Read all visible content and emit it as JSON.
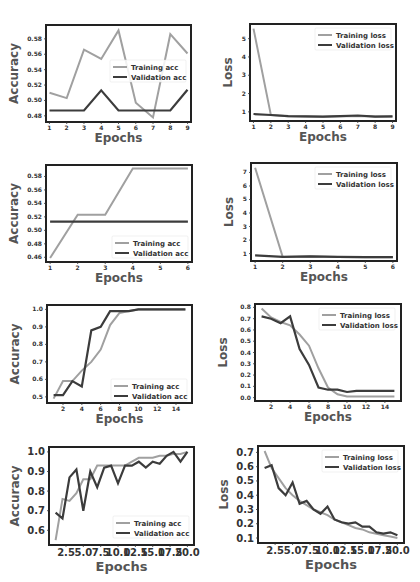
{
  "colors": {
    "training": "#a0a0a0",
    "validation": "#3c3c3c",
    "frame": "#222222"
  },
  "chart_data": [
    {
      "id": "acc-1",
      "type": "line",
      "title": "",
      "xlabel": "Epochs",
      "ylabel": "Accuracy",
      "xlim": [
        0.8,
        9.2
      ],
      "ylim": [
        0.472,
        0.598
      ],
      "xticks": [
        1,
        2,
        3,
        4,
        5,
        6,
        7,
        8,
        9
      ],
      "xtick_labels": [
        "1",
        "2",
        "3",
        "4",
        "5",
        "6",
        "7",
        "8",
        "9"
      ],
      "yticks": [
        0.48,
        0.5,
        0.52,
        0.54,
        0.56,
        0.58
      ],
      "ytick_labels": [
        "0.48",
        "0.50",
        "0.52",
        "0.54",
        "0.56",
        "0.58"
      ],
      "legend_position": "center-right",
      "series": [
        {
          "name": "Training acc",
          "role": "training",
          "x": [
            1,
            2,
            3,
            4,
            5,
            6,
            7,
            8,
            9
          ],
          "values": [
            0.51,
            0.503,
            0.566,
            0.554,
            0.591,
            0.497,
            0.478,
            0.586,
            0.561
          ]
        },
        {
          "name": "Validation acc",
          "role": "validation",
          "x": [
            1,
            2,
            3,
            4,
            5,
            6,
            7,
            8,
            9
          ],
          "values": [
            0.487,
            0.487,
            0.487,
            0.513,
            0.487,
            0.487,
            0.487,
            0.487,
            0.514
          ]
        }
      ]
    },
    {
      "id": "loss-1",
      "type": "line",
      "title": "",
      "xlabel": "Epochs",
      "ylabel": "Loss",
      "xlim": [
        0.8,
        9.2
      ],
      "ylim": [
        0.5,
        5.8
      ],
      "xticks": [
        1,
        2,
        3,
        4,
        5,
        6,
        7,
        8,
        9
      ],
      "xtick_labels": [
        "1",
        "2",
        "3",
        "4",
        "5",
        "6",
        "7",
        "8",
        "9"
      ],
      "yticks": [
        1,
        2,
        3,
        4,
        5
      ],
      "ytick_labels": [
        "1",
        "2",
        "3",
        "4",
        "5"
      ],
      "legend_position": "top-right",
      "series": [
        {
          "name": "Training loss",
          "role": "training",
          "x": [
            1,
            2,
            3,
            4,
            5,
            6,
            7,
            8,
            9
          ],
          "values": [
            5.55,
            0.82,
            0.76,
            0.75,
            0.73,
            0.76,
            0.78,
            0.74,
            0.75
          ]
        },
        {
          "name": "Validation loss",
          "role": "validation",
          "x": [
            1,
            2,
            3,
            4,
            5,
            6,
            7,
            8,
            9
          ],
          "values": [
            0.88,
            0.83,
            0.76,
            0.75,
            0.74,
            0.76,
            0.8,
            0.74,
            0.75
          ]
        }
      ]
    },
    {
      "id": "acc-2",
      "type": "line",
      "title": "",
      "xlabel": "Epochs",
      "ylabel": "Accuracy",
      "xlim": [
        0.85,
        6.15
      ],
      "ylim": [
        0.453,
        0.597
      ],
      "xticks": [
        1,
        2,
        3,
        4,
        5,
        6
      ],
      "xtick_labels": [
        "1",
        "2",
        "3",
        "4",
        "5",
        "6"
      ],
      "yticks": [
        0.46,
        0.48,
        0.5,
        0.52,
        0.54,
        0.56,
        0.58
      ],
      "ytick_labels": [
        "0.46",
        "0.48",
        "0.50",
        "0.52",
        "0.54",
        "0.56",
        "0.58"
      ],
      "legend_position": "lower-right",
      "series": [
        {
          "name": "Training acc",
          "role": "training",
          "x": [
            1,
            2,
            3,
            4,
            5,
            6
          ],
          "values": [
            0.459,
            0.523,
            0.523,
            0.592,
            0.592,
            0.592
          ]
        },
        {
          "name": "Validation acc",
          "role": "validation",
          "x": [
            1,
            2,
            3,
            4,
            5,
            6
          ],
          "values": [
            0.513,
            0.513,
            0.513,
            0.513,
            0.513,
            0.513
          ]
        }
      ]
    },
    {
      "id": "loss-2",
      "type": "line",
      "title": "",
      "xlabel": "Epochs",
      "ylabel": "Loss",
      "xlim": [
        0.85,
        6.15
      ],
      "ylim": [
        0.45,
        7.7
      ],
      "xticks": [
        1,
        2,
        3,
        4,
        5,
        6
      ],
      "xtick_labels": [
        "1",
        "2",
        "3",
        "4",
        "5",
        "6"
      ],
      "yticks": [
        1,
        2,
        3,
        4,
        5,
        6,
        7
      ],
      "ytick_labels": [
        "1",
        "2",
        "3",
        "4",
        "5",
        "6",
        "7"
      ],
      "legend_position": "top-right",
      "series": [
        {
          "name": "Training loss",
          "role": "training",
          "x": [
            1,
            2,
            3,
            4,
            5,
            6
          ],
          "values": [
            7.35,
            0.75,
            0.78,
            0.75,
            0.73,
            0.73
          ]
        },
        {
          "name": "Validation loss",
          "role": "validation",
          "x": [
            1,
            2,
            3,
            4,
            5,
            6
          ],
          "values": [
            0.87,
            0.76,
            0.8,
            0.75,
            0.73,
            0.73
          ]
        }
      ]
    },
    {
      "id": "acc-3",
      "type": "line",
      "title": "",
      "xlabel": "Epochs",
      "ylabel": "Accuracy",
      "xlim": [
        0.3,
        15.7
      ],
      "ylim": [
        0.465,
        1.025
      ],
      "xticks": [
        2,
        4,
        6,
        8,
        10,
        12,
        14
      ],
      "xtick_labels": [
        "2",
        "4",
        "6",
        "8",
        "10",
        "12",
        "14"
      ],
      "yticks": [
        0.5,
        0.6,
        0.7,
        0.8,
        0.9,
        1.0
      ],
      "ytick_labels": [
        "0.5",
        "0.6",
        "0.7",
        "0.8",
        "0.9",
        "1.0"
      ],
      "legend_position": "lower-right",
      "series": [
        {
          "name": "Training acc",
          "role": "training",
          "x": [
            1,
            2,
            3,
            4,
            5,
            6,
            7,
            8,
            9,
            10,
            11,
            12,
            13,
            14,
            15
          ],
          "values": [
            0.49,
            0.59,
            0.59,
            0.65,
            0.7,
            0.77,
            0.91,
            0.98,
            0.99,
            1.0,
            1.0,
            1.0,
            1.0,
            1.0,
            1.0
          ]
        },
        {
          "name": "Validation acc",
          "role": "validation",
          "x": [
            1,
            2,
            3,
            4,
            5,
            6,
            7,
            8,
            9,
            10,
            11,
            12,
            13,
            14,
            15
          ],
          "values": [
            0.51,
            0.51,
            0.59,
            0.56,
            0.88,
            0.9,
            0.99,
            0.99,
            0.99,
            1.0,
            1.0,
            1.0,
            1.0,
            1.0,
            1.0
          ]
        }
      ]
    },
    {
      "id": "loss-3",
      "type": "line",
      "title": "",
      "xlabel": "Epochs",
      "ylabel": "Loss",
      "xlim": [
        0.3,
        15.7
      ],
      "ylim": [
        -0.03,
        0.83
      ],
      "xticks": [
        2,
        4,
        6,
        8,
        10,
        12,
        14
      ],
      "xtick_labels": [
        "2",
        "4",
        "6",
        "8",
        "10",
        "12",
        "14"
      ],
      "yticks": [
        0.0,
        0.1,
        0.2,
        0.3,
        0.4,
        0.5,
        0.6,
        0.7,
        0.8
      ],
      "ytick_labels": [
        "0.0",
        "0.1",
        "0.2",
        "0.3",
        "0.4",
        "0.5",
        "0.6",
        "0.7",
        "0.8"
      ],
      "legend_position": "top-right",
      "series": [
        {
          "name": "Training loss",
          "role": "training",
          "x": [
            1,
            2,
            3,
            4,
            5,
            6,
            7,
            8,
            9,
            10,
            11,
            12,
            13,
            14,
            15
          ],
          "values": [
            0.79,
            0.71,
            0.67,
            0.64,
            0.56,
            0.46,
            0.26,
            0.09,
            0.03,
            0.01,
            0.01,
            0.01,
            0.01,
            0.01,
            0.01
          ]
        },
        {
          "name": "Validation loss",
          "role": "validation",
          "x": [
            1,
            2,
            3,
            4,
            5,
            6,
            7,
            8,
            9,
            10,
            11,
            12,
            13,
            14,
            15
          ],
          "values": [
            0.72,
            0.7,
            0.66,
            0.72,
            0.43,
            0.29,
            0.09,
            0.07,
            0.07,
            0.05,
            0.06,
            0.06,
            0.06,
            0.06,
            0.06
          ]
        }
      ]
    },
    {
      "id": "acc-4",
      "type": "line",
      "title": "",
      "xlabel": "Epochs",
      "ylabel": "Accuracy",
      "xlim": [
        0.05,
        20.95
      ],
      "ylim": [
        0.525,
        1.025
      ],
      "xticks": [
        2.5,
        5.0,
        7.5,
        10.0,
        12.5,
        15.0,
        17.5,
        20.0
      ],
      "xtick_labels": [
        "2.5",
        "5.0",
        "7.5",
        "10.0",
        "12.5",
        "15.0",
        "17.5",
        "20.0"
      ],
      "yticks": [
        0.6,
        0.7,
        0.8,
        0.9,
        1.0
      ],
      "ytick_labels": [
        "0.6",
        "0.7",
        "0.8",
        "0.9",
        "1.0"
      ],
      "legend_position": "lower-right",
      "series": [
        {
          "name": "Training acc",
          "role": "training",
          "x": [
            1,
            2,
            3,
            4,
            5,
            6,
            7,
            8,
            9,
            10,
            11,
            12,
            13,
            14,
            15,
            16,
            17,
            18,
            19,
            20
          ],
          "values": [
            0.55,
            0.76,
            0.75,
            0.79,
            0.86,
            0.86,
            0.93,
            0.93,
            0.93,
            0.93,
            0.93,
            0.95,
            0.97,
            0.97,
            0.97,
            0.98,
            0.98,
            0.99,
            0.99,
            1.0
          ]
        },
        {
          "name": "Validation acc",
          "role": "validation",
          "x": [
            1,
            2,
            3,
            4,
            5,
            6,
            7,
            8,
            9,
            10,
            11,
            12,
            13,
            14,
            15,
            16,
            17,
            18,
            19,
            20
          ],
          "values": [
            0.69,
            0.66,
            0.87,
            0.91,
            0.7,
            0.9,
            0.82,
            0.92,
            0.93,
            0.84,
            0.93,
            0.93,
            0.95,
            0.92,
            0.95,
            0.94,
            0.98,
            1.0,
            0.95,
            1.0
          ]
        }
      ]
    },
    {
      "id": "loss-4",
      "type": "line",
      "title": "",
      "xlabel": "Epochs",
      "ylabel": "Loss",
      "xlim": [
        0.05,
        20.95
      ],
      "ylim": [
        0.065,
        0.745
      ],
      "xticks": [
        2.5,
        5.0,
        7.5,
        10.0,
        12.5,
        15.0,
        17.5,
        20.0
      ],
      "xtick_labels": [
        "2.5",
        "5.0",
        "7.5",
        "10.0",
        "12.5",
        "15.0",
        "17.5",
        "20.0"
      ],
      "yticks": [
        0.1,
        0.2,
        0.3,
        0.4,
        0.5,
        0.6,
        0.7
      ],
      "ytick_labels": [
        "0.1",
        "0.2",
        "0.3",
        "0.4",
        "0.5",
        "0.6",
        "0.7"
      ],
      "legend_position": "top-right",
      "series": [
        {
          "name": "Training loss",
          "role": "training",
          "x": [
            1,
            2,
            3,
            4,
            5,
            6,
            7,
            8,
            9,
            10,
            11,
            12,
            13,
            14,
            15,
            16,
            17,
            18,
            19,
            20
          ],
          "values": [
            0.71,
            0.59,
            0.52,
            0.45,
            0.4,
            0.36,
            0.33,
            0.3,
            0.28,
            0.26,
            0.23,
            0.21,
            0.19,
            0.17,
            0.16,
            0.14,
            0.13,
            0.12,
            0.11,
            0.1
          ]
        },
        {
          "name": "Validation loss",
          "role": "validation",
          "x": [
            1,
            2,
            3,
            4,
            5,
            6,
            7,
            8,
            9,
            10,
            11,
            12,
            13,
            14,
            15,
            16,
            17,
            18,
            19,
            20
          ],
          "values": [
            0.59,
            0.61,
            0.45,
            0.4,
            0.49,
            0.34,
            0.36,
            0.3,
            0.27,
            0.32,
            0.23,
            0.21,
            0.2,
            0.21,
            0.18,
            0.18,
            0.14,
            0.13,
            0.14,
            0.12
          ]
        }
      ]
    }
  ]
}
